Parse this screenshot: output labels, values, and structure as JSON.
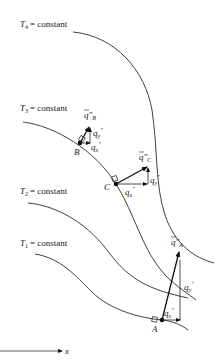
{
  "diagram": {
    "isotherms": [
      {
        "id": "T4",
        "symbol": "T",
        "subscript": "4",
        "text": "= constant"
      },
      {
        "id": "T3",
        "symbol": "T",
        "subscript": "3",
        "text": "= constant"
      },
      {
        "id": "T2",
        "symbol": "T",
        "subscript": "2",
        "text": "= constant"
      },
      {
        "id": "T1",
        "symbol": "T",
        "subscript": "1",
        "text": "= constant"
      }
    ],
    "points": [
      {
        "id": "B",
        "label": "B",
        "flux_vector": "q″",
        "flux_sub": "B",
        "qx": "q",
        "qx_sub": "x",
        "qy": "q",
        "qy_sub": "y",
        "prime": "″"
      },
      {
        "id": "C",
        "label": "C",
        "flux_vector": "q″",
        "flux_sub": "C",
        "qx": "q",
        "qx_sub": "x",
        "qy": "q",
        "qy_sub": "y",
        "prime": "″"
      },
      {
        "id": "A",
        "label": "A",
        "flux_vector": "q″",
        "flux_sub": "A",
        "qx": "q",
        "qx_sub": "x",
        "qy": "q",
        "qy_sub": "y",
        "prime": "″"
      }
    ],
    "axis": {
      "label": "x"
    },
    "colors": {
      "line": "#2a2a2a",
      "text": "#1a1a1a",
      "background": "#ffffff"
    }
  }
}
